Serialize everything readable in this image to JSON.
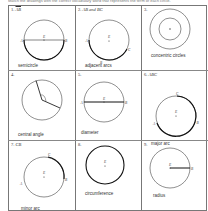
{
  "instructions": "Match the drawings with the correct vocabulary word that represents the term of each circle.",
  "cells": [
    {
      "number": "1.",
      "notation": "AB",
      "label": "semicircle",
      "points": {
        "a": "A",
        "b": "B",
        "center": "E"
      }
    },
    {
      "number": "2.",
      "notation": "AB and BC",
      "label": "adjacent arcs",
      "points": {
        "a": "A",
        "b": "B",
        "c": "C",
        "center": "E"
      }
    },
    {
      "number": "3.",
      "notation": "",
      "label": "concentric circles",
      "points": {}
    },
    {
      "number": "4.",
      "notation": "",
      "label": "central angle",
      "points": {}
    },
    {
      "number": "5.",
      "notation": "",
      "label": "diameter",
      "points": {
        "a": "A",
        "b": "B",
        "center": "E"
      }
    },
    {
      "number": "6.",
      "notation": "ABC",
      "label": "major arc",
      "points": {
        "a": "A",
        "b": "B",
        "c": "C",
        "center": "E"
      }
    },
    {
      "number": "7.",
      "notation": "CB",
      "label": "minor arc",
      "points": {
        "a": "A",
        "b": "B",
        "c": "C",
        "center": "E"
      }
    },
    {
      "number": "8.",
      "notation": "",
      "label": "circumference",
      "points": {
        "center": "E"
      }
    },
    {
      "number": "9.",
      "notation": "",
      "label": "radius",
      "points": {
        "b": "B",
        "center": "E"
      }
    }
  ],
  "colors": {
    "line": "#333333",
    "grid": "#777777",
    "text": "#333333"
  }
}
